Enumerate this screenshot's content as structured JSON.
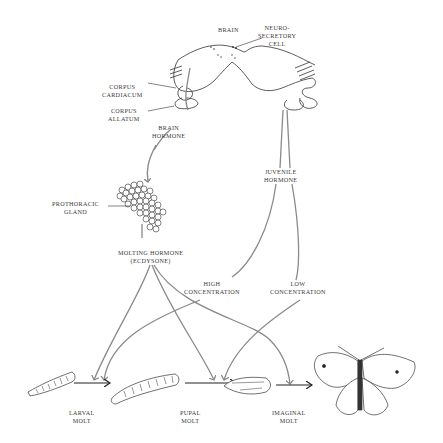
{
  "diagram": {
    "labels": {
      "brain": "BRAIN",
      "neurosecretory_cell": [
        "NEURO-",
        "SECRETORY",
        "CELL"
      ],
      "corpus_cardiacum": [
        "CORPUS",
        "CARDIACUM"
      ],
      "corpus_allatum": [
        "CORPUS",
        "ALLATUM"
      ],
      "brain_hormone": [
        "BRAIN",
        "HORMONE"
      ],
      "juvenile_hormone": [
        "JUVENILE",
        "HORMONE"
      ],
      "prothoracic_gland": [
        "PROTHORACIC",
        "GLAND"
      ],
      "molting_hormone": [
        "MOLTING HORMONE",
        "(ECDYSONE)"
      ],
      "high_concentration": [
        "HIGH",
        "CONCENTRATION"
      ],
      "low_concentration": [
        "LOW",
        "CONCENTRATION"
      ],
      "larval_molt": [
        "LARVAL",
        "MOLT"
      ],
      "pupal_molt": [
        "PUPAL",
        "MOLT"
      ],
      "imaginal_molt": [
        "IMAGINAL",
        "MOLT"
      ]
    },
    "stages": [
      "larva",
      "larger larva",
      "pupa",
      "adult butterfly"
    ],
    "colors": {
      "hormone_arrow": "#8a8a8a",
      "stage_arrow": "#222222",
      "outline": "#333333",
      "text": "#3a3a3a"
    }
  }
}
